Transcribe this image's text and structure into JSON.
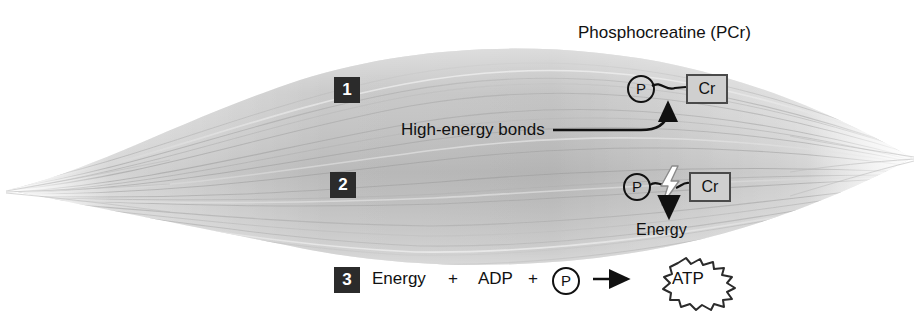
{
  "figure": {
    "title": "Phosphocreatine (PCr)"
  },
  "labels": {
    "high_energy_bonds": "High-energy bonds",
    "energy_released": "Energy"
  },
  "steps": [
    {
      "number": "1",
      "molecule": {
        "phosphate": "P",
        "creatine": "Cr",
        "bond": "intact-wavy-bond"
      }
    },
    {
      "number": "2",
      "molecule": {
        "phosphate": "P",
        "creatine": "Cr",
        "bond": "broken-bond-lightning"
      },
      "output": "Energy"
    },
    {
      "number": "3",
      "equation": {
        "term1": "Energy",
        "plus1": "+",
        "term2": "ADP",
        "plus2": "+",
        "term3": "P",
        "arrow": "→",
        "product": "ATP"
      }
    }
  ],
  "icons": {
    "phosphate_circle": "phosphate-circle-icon",
    "creatine_box": "creatine-box-icon",
    "lightning_bolt": "lightning-bolt-icon",
    "down_arrow": "down-arrow-icon",
    "up_arrow": "up-arrow-icon",
    "right_arrow": "right-arrow-icon",
    "atp_burst": "atp-starburst-icon"
  },
  "colors": {
    "badge_fill": "#2b2b2b",
    "badge_text": "#ffffff",
    "ink": "#111111",
    "creatine_fill": "#cfcfcf",
    "creatine_stroke": "#4a4a4a",
    "fiber_light": "#f2f2f2",
    "fiber_mid": "#c9c9c9",
    "fiber_dark": "#9a9a9a",
    "background": "#ffffff"
  }
}
